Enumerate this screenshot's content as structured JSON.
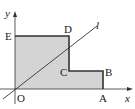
{
  "diagram": {
    "type": "coordinate-geometry",
    "axes": {
      "x_label": "x",
      "y_label": "y",
      "origin_label": "O"
    },
    "points": {
      "O": "O",
      "A": "A",
      "B": "B",
      "C": "C",
      "D": "D",
      "E": "E"
    },
    "line_label": "l",
    "colors": {
      "fill": "#d4d4d4",
      "stroke": "#333333",
      "background": "#ffffff"
    }
  }
}
